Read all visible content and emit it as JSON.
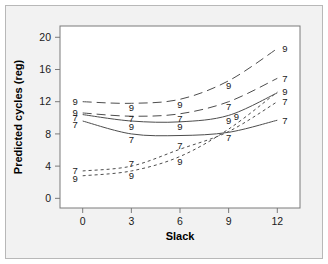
{
  "figure": {
    "background_color": "#f2f2f2",
    "plot_background_color": "#ffffff",
    "border_color": "#b8b8b8",
    "line_color": "#4d4d4d"
  },
  "chart_data": {
    "type": "line",
    "title": "",
    "xlabel": "Slack",
    "ylabel": "Predicted cycles (reg)",
    "x": [
      0,
      3,
      6,
      9,
      12
    ],
    "xticks": [
      "0",
      "3",
      "6",
      "9",
      "12"
    ],
    "yticks": [
      "0",
      "4",
      "8",
      "12",
      "16",
      "20"
    ],
    "xlim": [
      -1.4,
      13.4
    ],
    "ylim": [
      -1.2,
      21.4
    ],
    "grid": false,
    "legend": "none",
    "point_label_scheme": "each vertex annotated with its series group code (7 or 9)",
    "series": [
      {
        "name": "series-a-9",
        "group_code": "9",
        "linestyle": "long-dash",
        "values": [
          12.0,
          11.8,
          12.3,
          14.6,
          18.6
        ],
        "labels": [
          "9",
          "9",
          "9",
          "9",
          "9"
        ]
      },
      {
        "name": "series-b-7",
        "group_code": "7",
        "linestyle": "long-dash",
        "values": [
          10.6,
          10.2,
          10.5,
          12.0,
          14.9
        ],
        "labels": [
          "7",
          "7",
          "7",
          "7",
          "7"
        ]
      },
      {
        "name": "series-c-9",
        "group_code": "9",
        "linestyle": "solid",
        "values": [
          10.4,
          9.6,
          9.5,
          10.3,
          13.1
        ],
        "labels": [
          "9",
          "9",
          "9",
          "9",
          "9"
        ]
      },
      {
        "name": "series-d-7",
        "group_code": "7",
        "linestyle": "solid",
        "values": [
          9.6,
          8.0,
          7.8,
          8.2,
          9.7
        ],
        "labels": [
          "7",
          "7",
          "7",
          "7",
          "7"
        ]
      },
      {
        "name": "series-e-7",
        "group_code": "7",
        "linestyle": "short-dash",
        "values": [
          3.4,
          4.0,
          6.1,
          8.3,
          12.0
        ],
        "labels": [
          "7",
          "7",
          "7",
          "7",
          "7"
        ]
      },
      {
        "name": "series-f-9",
        "group_code": "9",
        "linestyle": "short-dash",
        "values": [
          2.8,
          3.4,
          5.2,
          8.6,
          13.2
        ],
        "labels": [
          "9",
          "9",
          "9",
          "9",
          "9"
        ]
      }
    ],
    "annotations": [
      {
        "x": 0,
        "y": 12.0,
        "text": "9",
        "place": "left"
      },
      {
        "x": 0,
        "y": 10.6,
        "text": "9",
        "place": "left"
      },
      {
        "x": 0,
        "y": 10.0,
        "text": "7",
        "place": "left"
      },
      {
        "x": 0,
        "y": 9.2,
        "text": "7",
        "place": "left"
      },
      {
        "x": 0,
        "y": 3.4,
        "text": "7",
        "place": "left"
      },
      {
        "x": 0,
        "y": 2.4,
        "text": "9",
        "place": "left"
      },
      {
        "x": 3,
        "y": 11.3,
        "text": "9",
        "place": "below"
      },
      {
        "x": 3,
        "y": 9.9,
        "text": "7",
        "place": "below"
      },
      {
        "x": 3,
        "y": 8.9,
        "text": "9",
        "place": "below"
      },
      {
        "x": 3,
        "y": 7.3,
        "text": "7",
        "place": "below"
      },
      {
        "x": 3,
        "y": 4.3,
        "text": "7",
        "place": "above"
      },
      {
        "x": 3,
        "y": 2.8,
        "text": "9",
        "place": "below"
      },
      {
        "x": 6,
        "y": 11.7,
        "text": "9",
        "place": "below"
      },
      {
        "x": 6,
        "y": 9.9,
        "text": "7",
        "place": "below"
      },
      {
        "x": 6,
        "y": 8.9,
        "text": "9",
        "place": "below"
      },
      {
        "x": 6,
        "y": 6.5,
        "text": "7",
        "place": "above"
      },
      {
        "x": 6,
        "y": 4.6,
        "text": "9",
        "place": "below"
      },
      {
        "x": 9,
        "y": 14.0,
        "text": "9",
        "place": "below"
      },
      {
        "x": 9,
        "y": 11.4,
        "text": "7",
        "place": "below"
      },
      {
        "x": 9,
        "y": 9.6,
        "text": "9",
        "place": "below"
      },
      {
        "x": 9,
        "y": 10.2,
        "text": "9",
        "place": "right"
      },
      {
        "x": 9,
        "y": 7.5,
        "text": "7",
        "place": "below"
      },
      {
        "x": 12,
        "y": 18.6,
        "text": "9",
        "place": "right"
      },
      {
        "x": 12,
        "y": 14.9,
        "text": "7",
        "place": "right"
      },
      {
        "x": 12,
        "y": 13.2,
        "text": "9",
        "place": "right"
      },
      {
        "x": 12,
        "y": 12.0,
        "text": "7",
        "place": "right"
      },
      {
        "x": 12,
        "y": 9.7,
        "text": "7",
        "place": "right"
      }
    ]
  }
}
